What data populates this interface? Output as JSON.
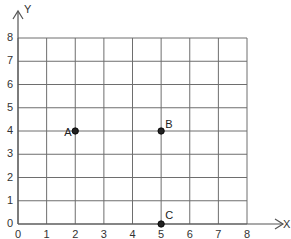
{
  "chart_data": {
    "type": "scatter",
    "title": "",
    "xlabel": "X",
    "ylabel": "Y",
    "xlim": [
      0,
      8
    ],
    "ylim": [
      0,
      8
    ],
    "grid": true,
    "x_ticks": [
      "0",
      "1",
      "2",
      "3",
      "4",
      "5",
      "6",
      "7",
      "8"
    ],
    "y_ticks": [
      "0",
      "1",
      "2",
      "3",
      "4",
      "5",
      "6",
      "7",
      "8"
    ],
    "points": [
      {
        "label": "A",
        "x": 2,
        "y": 4
      },
      {
        "label": "B",
        "x": 5,
        "y": 4
      },
      {
        "label": "C",
        "x": 5,
        "y": 0
      }
    ]
  },
  "colors": {
    "grid": "#6e6e6e",
    "axis": "#555555",
    "point": "#222222"
  }
}
